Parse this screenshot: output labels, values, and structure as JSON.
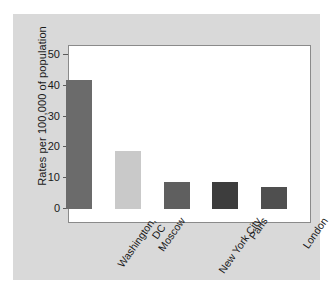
{
  "chart_data": {
    "type": "bar",
    "title": "",
    "xlabel": "",
    "ylabel": "Rates per 100,000 of population",
    "categories": [
      "Washington,\nDC",
      "Moscow",
      "New York City",
      "Paris",
      "London"
    ],
    "values": [
      42,
      19,
      8.7,
      8.8,
      7
    ],
    "bar_colors": [
      "#6b6b6b",
      "#c9c9c9",
      "#5f5f5f",
      "#3d3d3d",
      "#4f4f4f"
    ],
    "ylim": [
      0,
      57.8
    ],
    "yticks": [
      0,
      10,
      20,
      30,
      40,
      50
    ],
    "ytick_labels": [
      "0",
      "10",
      "20",
      "30",
      "40",
      "50"
    ],
    "grid": false,
    "legend": "none",
    "frame_color": "#8a8a8a",
    "panel_color": "#d9d9d9",
    "plot_background": "#ffffff"
  }
}
